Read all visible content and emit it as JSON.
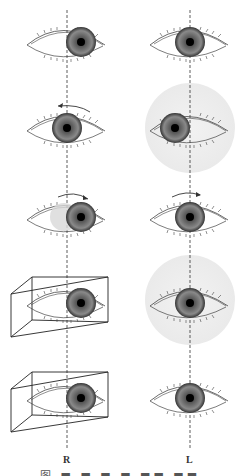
{
  "figure": {
    "columns": [
      {
        "id": "right-eye",
        "label": "R",
        "axis_x": 67
      },
      {
        "id": "left-eye",
        "label": "L",
        "axis_x": 190
      }
    ],
    "rows": [
      {
        "row": 1,
        "R": {
          "pupil_offset": "centered-right",
          "arrow": null,
          "prism": false,
          "shaded_circle": false
        },
        "L": {
          "pupil_offset": "centered",
          "arrow": null,
          "prism": false,
          "shaded_circle": false
        }
      },
      {
        "row": 2,
        "R": {
          "pupil_offset": "centered",
          "arrow": "left",
          "prism": false,
          "shaded_circle": false
        },
        "L": {
          "pupil_offset": "left",
          "arrow": null,
          "prism": false,
          "shaded_circle": true
        }
      },
      {
        "row": 3,
        "R": {
          "pupil_offset": "right",
          "arrow": "right",
          "prism": false,
          "shaded_circle": false,
          "ghost_iris": true
        },
        "L": {
          "pupil_offset": "centered",
          "arrow": "right",
          "prism": false,
          "shaded_circle": false
        }
      },
      {
        "row": 4,
        "R": {
          "pupil_offset": "right",
          "arrow": null,
          "prism": true,
          "shaded_circle": false
        },
        "L": {
          "pupil_offset": "centered",
          "arrow": null,
          "prism": false,
          "shaded_circle": true
        }
      },
      {
        "row": 5,
        "R": {
          "pupil_offset": "right",
          "arrow": null,
          "prism": true,
          "shaded_circle": false
        },
        "L": {
          "pupil_offset": "centered",
          "arrow": null,
          "prism": false,
          "shaded_circle": false
        }
      }
    ],
    "labels": {
      "right": "R",
      "left": "L"
    },
    "caption": "图 ■ ■ ■ ■ ■■ ■■"
  },
  "colors": {
    "line": "#333333",
    "iris_dark": "#2a2a2a",
    "iris_mid": "#7a7a7a",
    "shade": "#ececec"
  }
}
